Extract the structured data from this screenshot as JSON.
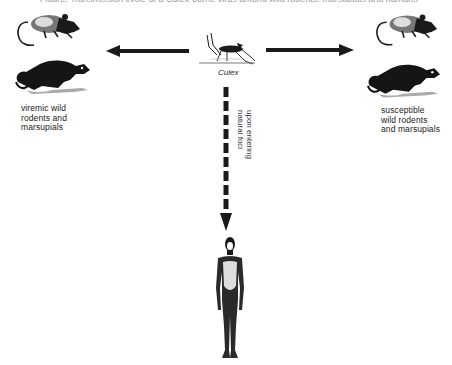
{
  "figure": {
    "top_cutoff_text": "Figure: Transmission cycle of a Culex-borne virus among wild rodents, marsupials and humans",
    "center": {
      "vector_label": "Culex",
      "vector_icon": "mosquito-icon"
    },
    "left_group": {
      "label_lines": [
        "viremic wild",
        "rodents and",
        "marsupials"
      ],
      "icons": [
        "rodent-icon",
        "marsupial-icon"
      ]
    },
    "right_group": {
      "label_lines": [
        "susceptible",
        "wild rodents",
        "and marsupials"
      ],
      "icons": [
        "rodent-icon",
        "marsupial-icon"
      ]
    },
    "down_arrow": {
      "label_lines": [
        "upon entering",
        "natural foci"
      ],
      "style": "dashed"
    },
    "bottom": {
      "icon": "human-figure-icon"
    },
    "arrows": [
      {
        "from": "Culex",
        "to": "viremic wild rodents and marsupials",
        "style": "solid"
      },
      {
        "from": "Culex",
        "to": "susceptible wild rodents and marsupials",
        "style": "solid"
      },
      {
        "from": "Culex",
        "to": "human",
        "style": "dashed",
        "label": "upon entering natural foci"
      }
    ],
    "colors": {
      "ink": "#1a1a1a",
      "background": "#ffffff"
    }
  }
}
